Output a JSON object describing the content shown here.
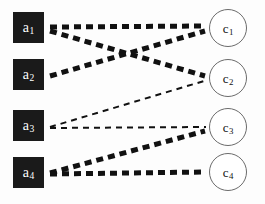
{
  "figure": {
    "type": "bipartite-graph",
    "background_color": "#fdfdfd",
    "width": 265,
    "height": 204
  },
  "left_nodes": [
    {
      "id": "a1",
      "base": "a",
      "sub": "1",
      "x": 13,
      "y": 12,
      "shape": "square",
      "fill": "#1a1a1a",
      "text_color": "#ffffff"
    },
    {
      "id": "a2",
      "base": "a",
      "sub": "2",
      "x": 13,
      "y": 59,
      "shape": "square",
      "fill": "#1a1a1a",
      "text_color": "#ffffff"
    },
    {
      "id": "a3",
      "base": "a",
      "sub": "3",
      "x": 13,
      "y": 110,
      "shape": "square",
      "fill": "#1a1a1a",
      "text_color": "#ffffff"
    },
    {
      "id": "a4",
      "base": "a",
      "sub": "4",
      "x": 13,
      "y": 157,
      "shape": "square",
      "fill": "#1a1a1a",
      "text_color": "#ffffff"
    }
  ],
  "right_nodes": [
    {
      "id": "c1",
      "base": "c",
      "sub": "1",
      "x": 209,
      "y": 9,
      "shape": "circle",
      "stroke": "#6b6b6b",
      "text_color": "#111111"
    },
    {
      "id": "c2",
      "base": "c",
      "sub": "2",
      "x": 209,
      "y": 59,
      "shape": "circle",
      "stroke": "#6b6b6b",
      "text_color": "#111111"
    },
    {
      "id": "c3",
      "base": "c",
      "sub": "3",
      "x": 209,
      "y": 108,
      "shape": "circle",
      "stroke": "#6b6b6b",
      "text_color": "#111111"
    },
    {
      "id": "c4",
      "base": "c",
      "sub": "4",
      "x": 209,
      "y": 153,
      "shape": "circle",
      "stroke": "#6b6b6b",
      "text_color": "#111111"
    }
  ],
  "edges": [
    {
      "id": "a1-c1",
      "from": "a1",
      "to": "c1",
      "x1": 50,
      "y1": 27,
      "x2": 206,
      "y2": 26,
      "weight": "thick",
      "stroke_width": 5,
      "dash": "7 5",
      "color": "#111111"
    },
    {
      "id": "a1-c2",
      "from": "a1",
      "to": "c2",
      "x1": 50,
      "y1": 31,
      "x2": 205,
      "y2": 76,
      "weight": "thick",
      "stroke_width": 5,
      "dash": "7 5",
      "color": "#111111"
    },
    {
      "id": "a2-c1",
      "from": "a2",
      "to": "c1",
      "x1": 50,
      "y1": 76,
      "x2": 205,
      "y2": 31,
      "weight": "thick",
      "stroke_width": 5,
      "dash": "7 5",
      "color": "#111111"
    },
    {
      "id": "a3-c2",
      "from": "a3",
      "to": "c2",
      "x1": 50,
      "y1": 127,
      "x2": 204,
      "y2": 81,
      "weight": "thin",
      "stroke_width": 2,
      "dash": "6 5",
      "color": "#111111"
    },
    {
      "id": "a3-c3",
      "from": "a3",
      "to": "c3",
      "x1": 50,
      "y1": 128,
      "x2": 206,
      "y2": 127,
      "weight": "thin",
      "stroke_width": 2,
      "dash": "6 5",
      "color": "#111111"
    },
    {
      "id": "a4-c3",
      "from": "a4",
      "to": "c3",
      "x1": 50,
      "y1": 173,
      "x2": 205,
      "y2": 131,
      "weight": "thick",
      "stroke_width": 5,
      "dash": "7 5",
      "color": "#111111"
    },
    {
      "id": "a4-c4",
      "from": "a4",
      "to": "c4",
      "x1": 50,
      "y1": 174,
      "x2": 206,
      "y2": 172,
      "weight": "thick",
      "stroke_width": 5,
      "dash": "7 5",
      "color": "#111111"
    }
  ]
}
